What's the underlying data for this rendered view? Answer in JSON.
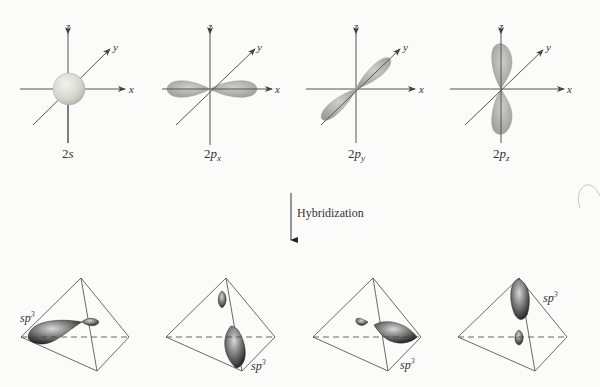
{
  "figure": {
    "atomic_orbitals": [
      {
        "label": "2s",
        "main": "2",
        "sub_main": "s",
        "subscript": ""
      },
      {
        "label": "2px",
        "main": "2",
        "sub_main": "p",
        "subscript": "x"
      },
      {
        "label": "2py",
        "main": "2",
        "sub_main": "p",
        "subscript": "y"
      },
      {
        "label": "2pz",
        "main": "2",
        "sub_main": "p",
        "subscript": "z"
      }
    ],
    "axes": {
      "x": "x",
      "y": "y",
      "z": "z"
    },
    "arrow_label": "Hybridization",
    "hybrid_orbitals": [
      {
        "label": "sp",
        "sup": "3"
      },
      {
        "label": "sp",
        "sup": "3"
      },
      {
        "label": "sp",
        "sup": "3"
      },
      {
        "label": "sp",
        "sup": "3"
      }
    ]
  }
}
